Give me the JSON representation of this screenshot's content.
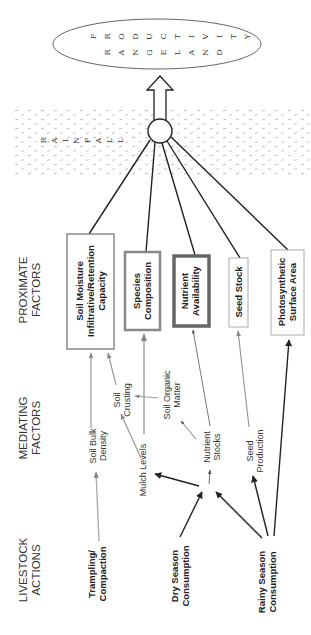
{
  "outcome": {
    "label": "RANGELAND PRODUCTIVITY",
    "line1": [
      "P",
      "R",
      "O",
      "D",
      "U",
      "C",
      "T",
      "I",
      "V",
      "I",
      "T",
      "Y"
    ],
    "line2": [
      "R",
      "A",
      "N",
      "G",
      "E",
      "L",
      "A",
      "N",
      "D"
    ]
  },
  "rainfall": {
    "label": "RAINFALL",
    "letters": [
      "R",
      "A",
      "I",
      "N",
      "F",
      "A",
      "L",
      "L"
    ]
  },
  "headers": {
    "proximate": [
      "PROXIMATE",
      "FACTORS"
    ],
    "mediating": [
      "MEDIATING",
      "FACTORS"
    ],
    "livestock": [
      "LIVESTOCK",
      "ACTIONS"
    ]
  },
  "proximate_factors": [
    {
      "id": "soil-moisture",
      "lines": [
        "Soil Moisture",
        "Infiltrative/Retention",
        "Capacity"
      ],
      "border_color": "#888888",
      "border_width": 1.5
    },
    {
      "id": "species-composition",
      "lines": [
        "Species",
        "Composition"
      ],
      "border_color": "#888888",
      "border_width": 2.5
    },
    {
      "id": "nutrient-availability",
      "lines": [
        "Nutrient",
        "Availability"
      ],
      "border_color": "#666666",
      "border_width": 3.5
    },
    {
      "id": "seed-stock",
      "lines": [
        "Seed Stock"
      ],
      "border_color": "#aaaaaa",
      "border_width": 1
    },
    {
      "id": "photosynthetic-surface-area",
      "lines": [
        "Photosynthetic",
        "Surface Area"
      ],
      "border_color": "#aaaaaa",
      "border_width": 1
    }
  ],
  "mediating_factors": [
    {
      "id": "soil-bulk-density",
      "lines": [
        "Soil Bulk",
        "Density"
      ]
    },
    {
      "id": "soil-crusting",
      "lines": [
        "Soil",
        "Crusting"
      ]
    },
    {
      "id": "soil-organic-matter",
      "lines": [
        "Soil Organic",
        "Matter"
      ]
    },
    {
      "id": "mulch-levels",
      "lines": [
        "Mulch Levels"
      ]
    },
    {
      "id": "nutrient-stocks",
      "lines": [
        "Nutrient",
        "Stocks"
      ]
    },
    {
      "id": "seed-production",
      "lines": [
        "Seed",
        "Production"
      ]
    }
  ],
  "livestock_actions": [
    {
      "id": "trampling-compaction",
      "lines": [
        "Trampling/",
        "Compaction"
      ]
    },
    {
      "id": "dry-season-consumption",
      "lines": [
        "Dry Season",
        "Consumption"
      ]
    },
    {
      "id": "rainy-season-consumption",
      "lines": [
        "Rainy Season",
        "Consumption"
      ]
    }
  ],
  "colors": {
    "line_dark": "#222222",
    "line_gray": "#999999",
    "line_mid": "#666666",
    "rain_dots": "#b0b0b0"
  }
}
